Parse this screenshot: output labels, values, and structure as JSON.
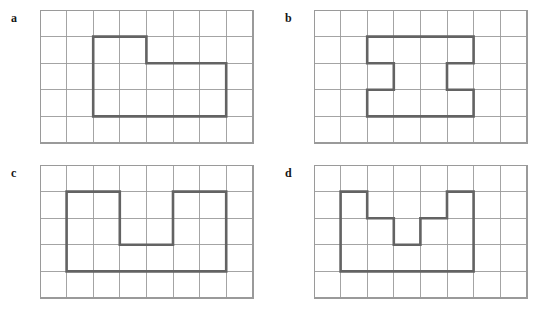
{
  "figure": {
    "background_color": "#ffffff",
    "grid_line_color": "#9a9a9a",
    "shape_stroke_color": "#636363",
    "label_color": "#161616",
    "panel_count": 4
  },
  "panels": [
    {
      "label": "a",
      "grid": {
        "cols": 8,
        "rows": 5,
        "cell_px": 26.6
      },
      "shape_name": "L-shaped-polygon",
      "vertices": [
        [
          2,
          1
        ],
        [
          4,
          1
        ],
        [
          4,
          2
        ],
        [
          7,
          2
        ],
        [
          7,
          4
        ],
        [
          2,
          4
        ]
      ],
      "closed": true
    },
    {
      "label": "b",
      "grid": {
        "cols": 8,
        "rows": 5,
        "cell_px": 26.6
      },
      "shape_name": "I-beam-polygon",
      "vertices": [
        [
          2,
          1
        ],
        [
          6,
          1
        ],
        [
          6,
          2
        ],
        [
          5,
          2
        ],
        [
          5,
          3
        ],
        [
          6,
          3
        ],
        [
          6,
          4
        ],
        [
          2,
          4
        ],
        [
          2,
          3
        ],
        [
          3,
          3
        ],
        [
          3,
          2
        ],
        [
          2,
          2
        ]
      ],
      "closed": true
    },
    {
      "label": "c",
      "grid": {
        "cols": 8,
        "rows": 5,
        "cell_px": 26.6
      },
      "shape_name": "U-shaped-polygon",
      "vertices": [
        [
          1,
          1
        ],
        [
          3,
          1
        ],
        [
          3,
          3
        ],
        [
          5,
          3
        ],
        [
          5,
          1
        ],
        [
          7,
          1
        ],
        [
          7,
          4
        ],
        [
          1,
          4
        ]
      ],
      "closed": true
    },
    {
      "label": "d",
      "grid": {
        "cols": 8,
        "rows": 5,
        "cell_px": 26.6
      },
      "shape_name": "stepped-U-polygon",
      "vertices": [
        [
          1,
          1
        ],
        [
          2,
          1
        ],
        [
          2,
          2
        ],
        [
          3,
          2
        ],
        [
          3,
          3
        ],
        [
          4,
          3
        ],
        [
          4,
          2
        ],
        [
          5,
          2
        ],
        [
          5,
          1
        ],
        [
          6,
          1
        ],
        [
          6,
          4
        ],
        [
          1,
          4
        ]
      ],
      "closed": true
    }
  ]
}
